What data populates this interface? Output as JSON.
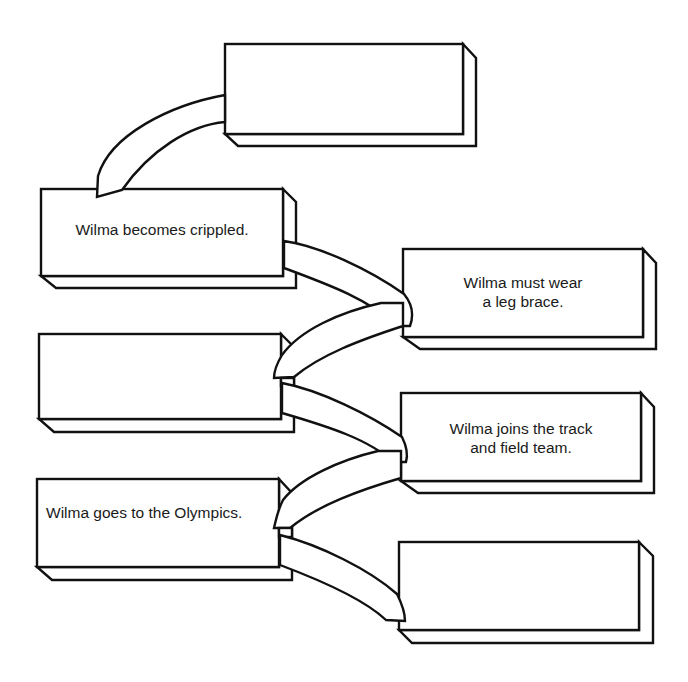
{
  "diagram": {
    "type": "sequence-of-events flow chart",
    "boxes": [
      {
        "id": "box-top",
        "label": ""
      },
      {
        "id": "box-1",
        "label": "Wilma becomes crippled."
      },
      {
        "id": "box-2",
        "label": "Wilma must wear\na leg brace."
      },
      {
        "id": "box-3",
        "label": ""
      },
      {
        "id": "box-4",
        "label": "Wilma joins the track\nand field team."
      },
      {
        "id": "box-5",
        "label": "Wilma goes to the Olympics."
      },
      {
        "id": "box-6",
        "label": ""
      }
    ],
    "connectors": [
      {
        "from": "box-1",
        "to": "box-top"
      },
      {
        "from": "box-1",
        "to": "box-2"
      },
      {
        "from": "box-2",
        "to": "box-3"
      },
      {
        "from": "box-3",
        "to": "box-4"
      },
      {
        "from": "box-4",
        "to": "box-5"
      },
      {
        "from": "box-5",
        "to": "box-6"
      }
    ],
    "colors": {
      "stroke": "#111111",
      "fill": "#ffffff",
      "text": "#1a1a1a"
    }
  }
}
